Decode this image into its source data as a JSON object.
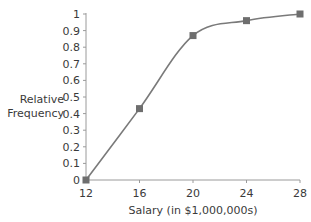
{
  "chart_data": {
    "type": "line",
    "title": "",
    "xlabel": "Salary (in $1,000,000s)",
    "ylabel": "Relative Frequency",
    "ylabel_lines": [
      "Relative",
      "Frequency"
    ],
    "x": [
      12,
      16,
      20,
      24,
      28
    ],
    "series": [
      {
        "name": "Cumulative relative frequency",
        "values": [
          0,
          0.43,
          0.87,
          0.96,
          1.0
        ]
      }
    ],
    "xticks": [
      12,
      16,
      20,
      24,
      28
    ],
    "yticks": [
      0,
      0.1,
      0.2,
      0.3,
      0.4,
      0.5,
      0.6,
      0.7,
      0.8,
      0.9,
      1
    ],
    "ytick_labels": [
      "0",
      "0.1",
      "0.2",
      "0.3",
      "0.4",
      "0.5",
      "0.6",
      "0.7",
      "0.8",
      "0.9",
      "1"
    ],
    "xlim": [
      12,
      28
    ],
    "ylim": [
      0,
      1
    ],
    "grid": false,
    "legend": null,
    "smooth": true,
    "markers": "square",
    "colors": {
      "line": "#7a7a7a",
      "marker": "#6e6e6e",
      "axis": "#9a9a9a",
      "text": "#3a3a3a"
    }
  }
}
